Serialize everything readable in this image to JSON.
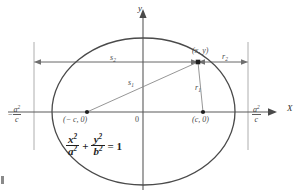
{
  "figure": {
    "axes": {
      "x_label": "X",
      "y_label": "y",
      "origin_label": "0"
    },
    "points": [
      {
        "name": "left-focus",
        "label": "(− c, 0)",
        "x": 87,
        "y": 112
      },
      {
        "name": "right-focus",
        "label": "(c, 0)",
        "x": 203,
        "y": 112
      },
      {
        "name": "point-on-ellipse",
        "label": "(x, y)",
        "x": 198,
        "y": 62
      }
    ],
    "segments": [
      {
        "name": "s2",
        "label": "s",
        "sub": "2"
      },
      {
        "name": "s1",
        "label": "s",
        "sub": "1"
      },
      {
        "name": "r2",
        "label": "r",
        "sub": "2"
      },
      {
        "name": "r1",
        "label": "r",
        "sub": "1"
      }
    ],
    "directrix_left": {
      "sign": "−",
      "numerator": "a",
      "num_exp": "2",
      "denominator": "c"
    },
    "directrix_right": {
      "sign": "",
      "numerator": "a",
      "num_exp": "2",
      "denominator": "c"
    },
    "equation": {
      "term1_num": "x",
      "term1_num_exp": "2",
      "term1_den": "a",
      "term1_den_exp": "2",
      "operator": "+",
      "term2_num": "y",
      "term2_num_exp": "2",
      "term2_den": "b",
      "term2_den_exp": "2",
      "equals": "= 1"
    },
    "colors": {
      "curve": "#4a4a4a",
      "axis": "#5a5a5a",
      "guide": "#9a9a9a",
      "text": "#3b3b3b",
      "background": "#ffffff"
    }
  }
}
